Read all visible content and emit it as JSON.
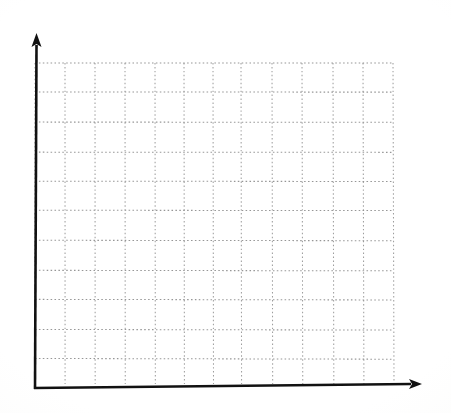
{
  "figure": {
    "title": "",
    "subtitle": "",
    "width": 451,
    "height": 413,
    "background_color": "#fefefe"
  },
  "axes": {
    "x_axis": {
      "name": "x-axis",
      "label": "",
      "color": "#111111",
      "start_x": 35,
      "end_x": 422,
      "y": 387,
      "arrow": true,
      "tick_labels": []
    },
    "y_axis": {
      "name": "y-axis",
      "label": "",
      "color": "#111111",
      "x": 35,
      "start_y": 388,
      "end_y": 33,
      "arrow": true,
      "tick_labels": []
    }
  },
  "grid": {
    "color": "#8e8e8e",
    "style": "dotted",
    "left": 35,
    "right": 393,
    "top": 63,
    "bottom": 358,
    "vertical_positions": [
      35,
      65,
      95,
      125,
      155,
      184,
      213,
      241,
      272,
      302,
      333,
      363,
      393
    ],
    "horizontal_positions": [
      63,
      92,
      122,
      152,
      181,
      210,
      240,
      270,
      299,
      329,
      358
    ],
    "columns": 12,
    "rows": 10
  },
  "chart_data": {
    "type": "line",
    "title": "",
    "subtitle": "",
    "xlabel": "",
    "ylabel": "",
    "categories": [],
    "x": [],
    "values": [],
    "series": [],
    "annotations": [],
    "legend": [],
    "legend_position": "none",
    "grid": true,
    "grid_style": "dotted",
    "xlim": [
      0,
      12
    ],
    "ylim": [
      0,
      10
    ],
    "xticks": [
      0,
      1,
      2,
      3,
      4,
      5,
      6,
      7,
      8,
      9,
      10,
      11,
      12
    ],
    "yticks": [
      0,
      1,
      2,
      3,
      4,
      5,
      6,
      7,
      8,
      9,
      10
    ],
    "xtick_labels": [],
    "ytick_labels": [],
    "note": "Empty plot area: no data series, no tick labels, no legend rendered in the image"
  }
}
